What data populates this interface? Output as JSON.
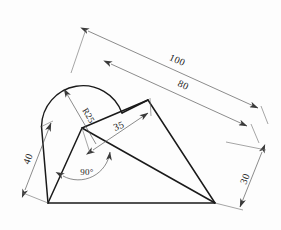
{
  "drawing": {
    "title": "Engineering dimensioned sketch",
    "style": {
      "background_color": "#fdfdfd",
      "outline_color": "#1a1a1a",
      "dimension_color": "#5a5a5a",
      "text_color": "#1a1a1a"
    },
    "dimensions": [
      {
        "id": "overall-length",
        "label": "100",
        "kind": "linear",
        "orientation": "oblique-top"
      },
      {
        "id": "inner-length",
        "label": "80",
        "kind": "linear",
        "orientation": "oblique-middle"
      },
      {
        "id": "mid-length",
        "label": "35",
        "kind": "linear",
        "orientation": "oblique-inner"
      },
      {
        "id": "left-height",
        "label": "40",
        "kind": "linear",
        "orientation": "oblique-left"
      },
      {
        "id": "right-height",
        "label": "30",
        "kind": "linear",
        "orientation": "oblique-right"
      },
      {
        "id": "arc-radius",
        "label": "R25",
        "kind": "radius",
        "orientation": "leader"
      },
      {
        "id": "corner-angle",
        "label": "90°",
        "kind": "angular",
        "orientation": "arc-sweep"
      }
    ],
    "geometry": {
      "bottom_left_vertex": "48,203",
      "bottom_right_vertex": "215,203",
      "arc_center": "82,128",
      "upper_right_vertex": "148,100",
      "arc_left_end": "41,125"
    }
  }
}
